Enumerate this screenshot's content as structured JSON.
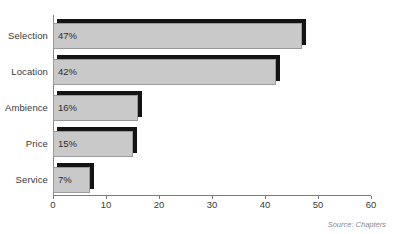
{
  "chart_data": {
    "type": "bar",
    "orientation": "horizontal",
    "title": "",
    "categories": [
      "Selection",
      "Location",
      "Ambience",
      "Price",
      "Service"
    ],
    "values": [
      47,
      42,
      16,
      15,
      7
    ],
    "value_labels": [
      "47%",
      "42%",
      "16%",
      "15%",
      "7%"
    ],
    "xlabel": "",
    "ylabel": "",
    "xlim": [
      0,
      60
    ],
    "xticks": [
      0,
      10,
      20,
      30,
      40,
      50,
      60
    ],
    "xtick_labels": [
      "0",
      "10",
      "20",
      "30",
      "40",
      "50",
      "60"
    ],
    "grid": false,
    "legend": false,
    "bar_color": "#c9c9c9",
    "bar_shadow_color": "#141414",
    "axis_color": "#7a7a7a"
  },
  "source": {
    "text": "Source: Chapters"
  }
}
